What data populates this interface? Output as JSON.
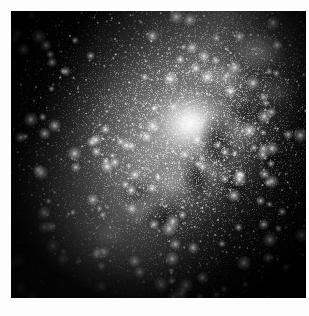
{
  "page": {
    "width": 309,
    "height": 316,
    "background_color": "#fdfdfd",
    "kind": "astrophotograph"
  },
  "image": {
    "title": "Milky Way galactic centre star cloud",
    "alt_text": "Grayscale long-exposure photograph of the Milky Way galactic bulge with bright central star cloud and dark dust lanes",
    "frame": {
      "left": 11,
      "top": 11,
      "width": 295,
      "height": 287
    },
    "palette": {
      "sky_black": "#050505",
      "deep_shadow": "#0b0b0b",
      "dust_lane": "#1c1c1c",
      "midtone_cloud": "#6e6e6e",
      "bright_cloud": "#b4b4b4",
      "core_highlight": "#f2f2f2",
      "margin_white": "#fdfdfd"
    },
    "features": [
      {
        "name": "central-star-cloud",
        "description": "Bright diffuse galactic bulge core",
        "center_pct": [
          61,
          39
        ],
        "brightness": "peak"
      },
      {
        "name": "galactic-band",
        "description": "Luminous band running from upper right to lower left",
        "angle_deg": 118
      },
      {
        "name": "dark-dust-lanes",
        "description": "Mottled obscuring dust to the right and below the core",
        "center_pct": [
          72,
          52
        ]
      },
      {
        "name": "lower-left-nebulosity",
        "description": "Faint detached glowing patch near the lower left corner",
        "center_pct": [
          12,
          88
        ]
      },
      {
        "name": "star-field",
        "description": "Dense field of faint unresolved stars across the whole frame"
      }
    ],
    "controls": {
      "caption": ""
    }
  }
}
